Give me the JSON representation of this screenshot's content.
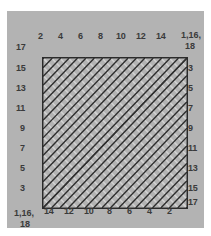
{
  "figure": {
    "kind": "string-art-envelope-diagram",
    "background_color": "#ffffff",
    "panel_color": "#b3b3b3",
    "frame_color": "#2b2b2b",
    "dark_line_color": "#2f2f2f",
    "light_line_color": "#d2d2d2",
    "label_color": "#3a3a3a"
  },
  "axes": {
    "top": {
      "labels": [
        "2",
        "4",
        "6",
        "8",
        "10",
        "12",
        "14"
      ],
      "order": "left-to-right ascending"
    },
    "bottom": {
      "labels": [
        "14",
        "12",
        "10",
        "8",
        "6",
        "4",
        "2"
      ],
      "order": "left-to-right descending"
    },
    "left": {
      "labels": [
        "17",
        "15",
        "13",
        "11",
        "9",
        "7",
        "5",
        "3"
      ],
      "order": "top-to-bottom descending odd"
    },
    "right": {
      "labels": [
        "3",
        "5",
        "7",
        "9",
        "11",
        "13",
        "15",
        "17"
      ],
      "order": "top-to-bottom ascending odd"
    },
    "corners": {
      "top_right_line1": "1,16,",
      "top_right_line2": "18",
      "bottom_left_line1": "1,16,",
      "bottom_left_line2": "18"
    }
  },
  "chart_data": {
    "type": "line",
    "title": "",
    "xlabel": "",
    "ylabel": "",
    "grid": false,
    "legend": "none",
    "node_count_per_side": 18,
    "series": [
      {
        "name": "dark-chords",
        "color": "#2f2f2f",
        "values": [
          1,
          2,
          3,
          4,
          5,
          6,
          7,
          8,
          9,
          10,
          11,
          12,
          13,
          14,
          15,
          16,
          17,
          18
        ]
      },
      {
        "name": "light-chords",
        "color": "#d2d2d2",
        "values": [
          1,
          2,
          3,
          4,
          5,
          6,
          7,
          8,
          9,
          10,
          11,
          12,
          13,
          14,
          15,
          16,
          17,
          18
        ]
      }
    ],
    "x": [
      1,
      2,
      3,
      4,
      5,
      6,
      7,
      8,
      9,
      10,
      11,
      12,
      13,
      14,
      15,
      16,
      17,
      18
    ],
    "xlim": [
      1,
      18
    ],
    "ylim": [
      1,
      18
    ]
  }
}
